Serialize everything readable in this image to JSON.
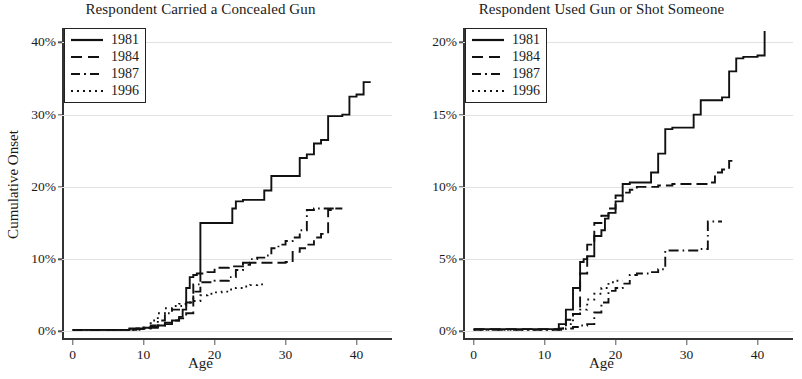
{
  "figure": {
    "ylabel": "Cumulative Onset"
  },
  "panels": [
    {
      "key": "concealed_gun",
      "title": "Respondent Carried a Concealed Gun",
      "xlabel": "Age",
      "yticks": [
        "0%",
        "10%",
        "20%",
        "30%",
        "40%"
      ],
      "ytick_values": [
        0,
        10,
        20,
        30,
        40
      ],
      "xticks": [
        "0",
        "10",
        "20",
        "30",
        "40"
      ],
      "xtick_values": [
        0,
        10,
        20,
        30,
        40
      ],
      "legend": [
        {
          "label": "1981",
          "style": "solid"
        },
        {
          "label": "1984",
          "style": "dashed"
        },
        {
          "label": "1987",
          "style": "dashdot"
        },
        {
          "label": "1996",
          "style": "dotted"
        }
      ]
    },
    {
      "key": "used_gun",
      "title": "Respondent Used Gun or Shot Someone",
      "xlabel": "Age",
      "yticks": [
        "0%",
        "5%",
        "10%",
        "15%",
        "20%"
      ],
      "ytick_values": [
        0,
        5,
        10,
        15,
        20
      ],
      "xticks": [
        "0",
        "10",
        "20",
        "30",
        "40"
      ],
      "xtick_values": [
        0,
        10,
        20,
        30,
        40
      ],
      "legend": [
        {
          "label": "1981",
          "style": "solid"
        },
        {
          "label": "1984",
          "style": "dashed"
        },
        {
          "label": "1987",
          "style": "dashdot"
        },
        {
          "label": "1996",
          "style": "dotted"
        }
      ]
    }
  ],
  "chart_data": [
    {
      "type": "line",
      "title": "Respondent Carried a Concealed Gun",
      "xlabel": "Age",
      "ylabel": "Cumulative Onset",
      "xlim": [
        -1.5,
        45
      ],
      "ylim": [
        -1.2,
        42
      ],
      "xticks": [
        0,
        10,
        20,
        30,
        40
      ],
      "yticks": [
        0,
        10,
        20,
        30,
        40
      ],
      "grid": "horizontal",
      "legend_position": "top-left",
      "step": "post",
      "series": [
        {
          "name": "1981",
          "style": "solid",
          "x": [
            0,
            7,
            8,
            10,
            11,
            12,
            13,
            14,
            15,
            15.5,
            16,
            16.5,
            17,
            17.5,
            18,
            22,
            22.5,
            23,
            24,
            27,
            28,
            29,
            30,
            31,
            32,
            33,
            34,
            35,
            36,
            38,
            39,
            40,
            41,
            42
          ],
          "y": [
            0.2,
            0.2,
            0.4,
            0.5,
            0.6,
            0.8,
            1.0,
            1.5,
            2.0,
            3.0,
            6.0,
            7.5,
            7.8,
            8.0,
            15.0,
            15.0,
            17.0,
            18.0,
            18.2,
            19.5,
            21.5,
            21.5,
            21.5,
            21.5,
            24.0,
            24.5,
            26.0,
            26.5,
            29.8,
            30.0,
            32.5,
            32.8,
            34.5,
            34.5
          ]
        },
        {
          "name": "1984",
          "style": "dashed",
          "x": [
            0,
            8,
            10,
            12,
            13,
            14,
            15,
            16,
            17,
            18,
            19,
            20,
            22,
            24,
            25,
            26,
            28,
            30,
            31,
            32,
            33,
            34,
            35,
            36,
            37,
            38
          ],
          "y": [
            0.2,
            0.3,
            0.5,
            0.8,
            1.2,
            1.5,
            1.8,
            2.5,
            5.5,
            8.0,
            8.2,
            8.8,
            9.0,
            9.2,
            9.5,
            9.5,
            9.5,
            9.6,
            11.0,
            11.5,
            12.0,
            13.0,
            13.5,
            16.8,
            17.0,
            17.0
          ]
        },
        {
          "name": "1987",
          "style": "dashdot",
          "x": [
            0,
            9,
            11,
            12,
            13,
            14,
            15,
            16,
            17,
            18,
            20,
            22,
            23,
            24,
            25,
            26,
            27,
            28,
            29,
            30,
            31,
            32,
            33,
            34,
            35,
            36,
            37
          ],
          "y": [
            0.2,
            0.4,
            0.8,
            1.5,
            2.5,
            3.0,
            3.5,
            4.0,
            6.5,
            6.8,
            7.0,
            7.5,
            8.5,
            9.5,
            10.0,
            10.2,
            10.5,
            11.5,
            12.0,
            12.5,
            13.0,
            14.0,
            16.8,
            17.0,
            17.0,
            17.0,
            17.0
          ]
        },
        {
          "name": "1996",
          "style": "dotted",
          "x": [
            0,
            10,
            11,
            12,
            13,
            14,
            15,
            16,
            17,
            18,
            19,
            20,
            21,
            22,
            23,
            24,
            25,
            26,
            27
          ],
          "y": [
            0.2,
            0.5,
            1.5,
            2.5,
            3.2,
            3.5,
            3.8,
            4.0,
            4.2,
            5.0,
            5.2,
            5.4,
            5.5,
            5.8,
            6.0,
            6.2,
            6.4,
            6.5,
            6.5
          ]
        }
      ]
    },
    {
      "type": "line",
      "title": "Respondent Used Gun or Shot Someone",
      "xlabel": "Age",
      "ylabel": "Cumulative Onset",
      "xlim": [
        -1.5,
        45
      ],
      "ylim": [
        -0.6,
        21
      ],
      "xticks": [
        0,
        10,
        20,
        30,
        40
      ],
      "yticks": [
        0,
        5,
        10,
        15,
        20
      ],
      "grid": "horizontal",
      "legend_position": "top-left",
      "step": "post",
      "series": [
        {
          "name": "1981",
          "style": "solid",
          "x": [
            0,
            11,
            12,
            13,
            14,
            15,
            15.5,
            16,
            17,
            18,
            18.5,
            19,
            20,
            21,
            22,
            24,
            25,
            26,
            27,
            28,
            30,
            31,
            32,
            33,
            34,
            35,
            36,
            37,
            38,
            39,
            40,
            41
          ],
          "y": [
            0.15,
            0.15,
            0.5,
            1.5,
            3.0,
            4.8,
            5.0,
            5.2,
            6.6,
            7.0,
            7.8,
            8.2,
            9.0,
            10.2,
            10.3,
            10.3,
            11.0,
            12.3,
            14.0,
            14.1,
            14.1,
            15.0,
            16.0,
            16.0,
            16.0,
            16.2,
            18.0,
            18.9,
            19.0,
            19.0,
            19.1,
            20.8
          ]
        },
        {
          "name": "1984",
          "style": "dashed",
          "x": [
            0,
            12,
            13,
            14,
            15,
            16,
            17,
            18,
            19,
            20,
            21,
            22,
            23,
            24,
            26,
            28,
            30,
            32,
            33,
            34,
            35,
            36,
            37
          ],
          "y": [
            0.15,
            0.2,
            0.8,
            1.2,
            4.0,
            6.0,
            7.5,
            8.0,
            8.5,
            9.4,
            9.6,
            9.8,
            10.0,
            10.0,
            10.1,
            10.2,
            10.2,
            10.2,
            10.3,
            11.0,
            11.2,
            11.8,
            11.8
          ]
        },
        {
          "name": "1987",
          "style": "dashdot",
          "x": [
            0,
            12,
            13,
            14,
            15,
            16,
            17,
            18,
            19,
            20,
            21,
            22,
            23,
            24,
            25,
            26,
            27,
            28,
            30,
            31,
            32,
            33,
            34,
            35
          ],
          "y": [
            0.1,
            0.1,
            0.2,
            0.3,
            0.4,
            0.5,
            1.3,
            2.0,
            2.8,
            3.0,
            3.3,
            3.9,
            4.0,
            4.0,
            4.1,
            4.3,
            5.6,
            5.6,
            5.6,
            5.6,
            5.7,
            7.6,
            7.6,
            7.6
          ]
        },
        {
          "name": "1996",
          "style": "dotted",
          "x": [
            0,
            12,
            13,
            14,
            15,
            16,
            17,
            18,
            19,
            20,
            21
          ],
          "y": [
            0.1,
            0.2,
            0.5,
            1.2,
            1.5,
            2.2,
            2.6,
            3.0,
            3.4,
            3.5,
            3.5
          ]
        }
      ]
    }
  ]
}
